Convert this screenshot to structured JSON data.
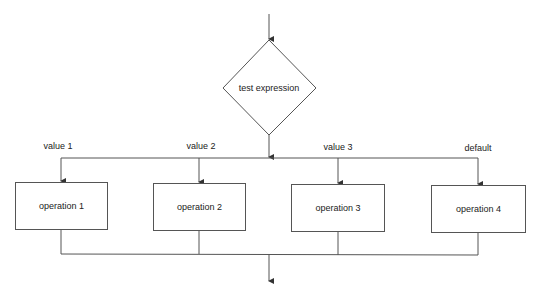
{
  "diagram": {
    "type": "flowchart",
    "decision": {
      "label": "test expression"
    },
    "branches": [
      {
        "case_label": "value 1",
        "operation": "operation 1"
      },
      {
        "case_label": "value 2",
        "operation": "operation 2"
      },
      {
        "case_label": "value 3",
        "operation": "operation 3"
      },
      {
        "case_label": "default",
        "operation": "operation 4"
      }
    ],
    "colors": {
      "line": "#555555",
      "text": "#222222",
      "background": "#ffffff"
    }
  }
}
